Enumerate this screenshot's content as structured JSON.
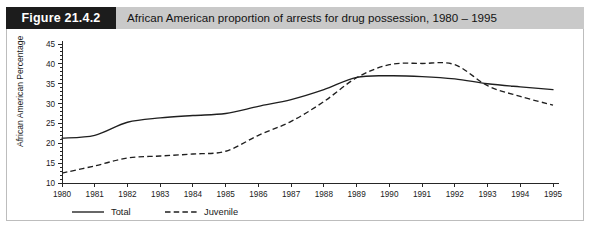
{
  "figure": {
    "badge_label": "Figure 21.4.2",
    "caption": "African American proportion of arrests for drug possession, 1980 – 1995"
  },
  "chart_data": {
    "type": "line",
    "title": "African American proportion of arrests for drug possession, 1980 – 1995",
    "xlabel": "",
    "ylabel": "African American Percentage",
    "categories": [
      "1980",
      "1981",
      "1982",
      "1983",
      "1984",
      "1985",
      "1986",
      "1987",
      "1988",
      "1989",
      "1990",
      "1991",
      "1992",
      "1993",
      "1994",
      "1995"
    ],
    "x": [
      1980,
      1981,
      1982,
      1983,
      1984,
      1985,
      1986,
      1987,
      1988,
      1989,
      1990,
      1991,
      1992,
      1993,
      1994,
      1995
    ],
    "series": [
      {
        "name": "Total",
        "style": "solid",
        "color": "#1f1f1f",
        "values": [
          21.3,
          22.0,
          25.3,
          26.4,
          27.0,
          27.5,
          29.3,
          31.0,
          33.5,
          36.6,
          37.0,
          36.8,
          36.2,
          35.0,
          34.2,
          33.5
        ]
      },
      {
        "name": "Juvenile",
        "style": "dashed",
        "color": "#1f1f1f",
        "values": [
          12.5,
          14.3,
          16.3,
          16.8,
          17.3,
          18.0,
          22.0,
          25.5,
          30.5,
          36.5,
          39.8,
          40.1,
          39.8,
          34.5,
          31.8,
          29.6
        ]
      }
    ],
    "ylim": [
      10,
      45
    ],
    "yticks": [
      10,
      15,
      20,
      25,
      30,
      35,
      40,
      45
    ],
    "ytick_labels": [
      "10",
      "15",
      "20",
      "25",
      "30",
      "35",
      "40",
      "45"
    ],
    "xlim": [
      1980,
      1995
    ],
    "grid": false,
    "legend_position": "below-left",
    "legend": [
      "Total",
      "Juvenile"
    ]
  },
  "axes": {
    "y_title": "African American Percentage"
  },
  "legend": {
    "total_label": "Total",
    "juvenile_label": "Juvenile"
  }
}
